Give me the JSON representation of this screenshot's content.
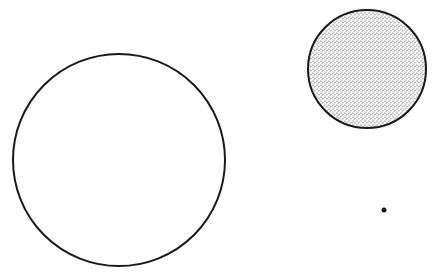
{
  "figure": {
    "background": "#ffffff",
    "stroke_color": "#1a1a1a",
    "stipple_color": "#555555",
    "shapes": [
      {
        "name": "large-circle",
        "cx": 119,
        "cy": 160,
        "r": 106,
        "fill": "none"
      },
      {
        "name": "stippled-circle",
        "cx": 367,
        "cy": 69,
        "r": 59,
        "fill": "stipple"
      },
      {
        "name": "dot",
        "cx": 384,
        "cy": 210,
        "r": 2.5,
        "fill": "solid"
      }
    ]
  }
}
